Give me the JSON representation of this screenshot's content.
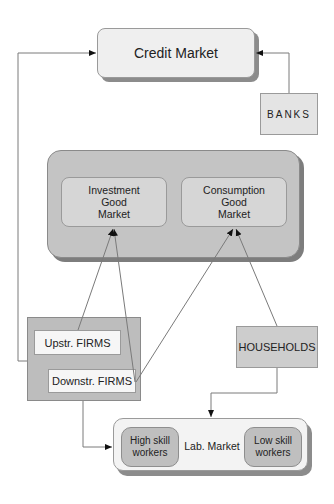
{
  "diagram": {
    "nodes": {
      "credit_market": {
        "label": "Credit Market"
      },
      "banks": {
        "label": "BANKS"
      },
      "goods_container": {
        "label": ""
      },
      "investment_market": {
        "line1": "Investment",
        "line2": "Good",
        "line3": "Market"
      },
      "consumption_market": {
        "line1": "Consumption",
        "line2": "Good",
        "line3": "Market"
      },
      "upstream_firms": {
        "label": "Upstr. FIRMS"
      },
      "downstream_firms": {
        "label": "Downstr. FIRMS"
      },
      "households": {
        "label": "HOUSEHOLDS"
      },
      "labor_market": {
        "label": "Lab. Market"
      },
      "high_skill": {
        "line1": "High skill",
        "line2": "workers"
      },
      "low_skill": {
        "line1": "Low skill",
        "line2": "workers"
      }
    },
    "edges": [
      {
        "from": "firms",
        "to": "credit_market"
      },
      {
        "from": "banks",
        "to": "credit_market"
      },
      {
        "from": "upstream_firms",
        "to": "investment_market"
      },
      {
        "from": "downstream_firms",
        "to": "investment_market"
      },
      {
        "from": "downstream_firms",
        "to": "consumption_market"
      },
      {
        "from": "households",
        "to": "consumption_market"
      },
      {
        "from": "firms",
        "to": "labor_market"
      },
      {
        "from": "households",
        "to": "labor_market"
      }
    ],
    "colors": {
      "line": "#7a7a7a",
      "arrow": "#111111"
    }
  }
}
